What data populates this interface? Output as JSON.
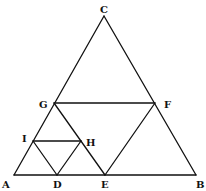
{
  "diagram": {
    "type": "geometry",
    "points": {
      "A": {
        "x": 14,
        "y": 175
      },
      "B": {
        "x": 196,
        "y": 175
      },
      "C": {
        "x": 104,
        "y": 16
      },
      "D": {
        "x": 57,
        "y": 175
      },
      "E": {
        "x": 105,
        "y": 175
      },
      "F": {
        "x": 155,
        "y": 103
      },
      "G": {
        "x": 54,
        "y": 103
      },
      "H": {
        "x": 81,
        "y": 141
      },
      "I": {
        "x": 33,
        "y": 141
      }
    },
    "segments": [
      [
        "A",
        "B"
      ],
      [
        "B",
        "C"
      ],
      [
        "C",
        "A"
      ],
      [
        "G",
        "F"
      ],
      [
        "G",
        "E"
      ],
      [
        "E",
        "F"
      ],
      [
        "I",
        "H"
      ],
      [
        "I",
        "D"
      ],
      [
        "D",
        "H"
      ]
    ],
    "labels": [
      {
        "name": "A",
        "text": "A",
        "x": 2,
        "y": 188
      },
      {
        "name": "B",
        "text": "B",
        "x": 196,
        "y": 188
      },
      {
        "name": "C",
        "text": "C",
        "x": 100,
        "y": 13
      },
      {
        "name": "D",
        "text": "D",
        "x": 53,
        "y": 188
      },
      {
        "name": "E",
        "text": "E",
        "x": 101,
        "y": 188
      },
      {
        "name": "F",
        "text": "F",
        "x": 164,
        "y": 108
      },
      {
        "name": "G",
        "text": "G",
        "x": 39,
        "y": 108
      },
      {
        "name": "H",
        "text": "H",
        "x": 86,
        "y": 146
      },
      {
        "name": "I",
        "text": "I",
        "x": 22,
        "y": 142
      }
    ],
    "stroke_color": "#111111",
    "background_color": "#ffffff"
  }
}
